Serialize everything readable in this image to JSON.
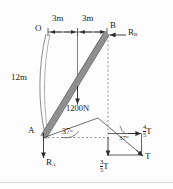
{
  "figure": {
    "type": "engineering-free-body-diagram",
    "title_text": "",
    "points": {
      "O": {
        "label": "O",
        "x": 43,
        "y": 31
      },
      "B": {
        "label": "B",
        "x": 108,
        "y": 30
      },
      "A": {
        "label": "A",
        "x": 41,
        "y": 136
      }
    },
    "dimensions": [
      {
        "label": "3m",
        "span": "O-to-midpoint"
      },
      {
        "label": "3m",
        "span": "midpoint-to-B"
      },
      {
        "label": "12m",
        "span": "O-to-A arc"
      }
    ],
    "loads": [
      {
        "label": "1200N",
        "direction": "down",
        "applied_at": "beam midpoint"
      }
    ],
    "reactions": [
      {
        "label": "R",
        "subscript": "B",
        "direction": "left",
        "at": "B"
      },
      {
        "label": "R",
        "subscript": "A",
        "direction": "down",
        "at": "A"
      }
    ],
    "angles": [
      {
        "value": "37",
        "unit": "o",
        "at": "A",
        "name": "beam-inclination"
      },
      {
        "value": "37",
        "unit": "o",
        "at": "force-triangle",
        "name": "tension-angle"
      }
    ],
    "tension_components": [
      {
        "numerator": "4",
        "denominator": "5",
        "symbol": "T",
        "name": "horizontal-component"
      },
      {
        "numerator": "3",
        "denominator": "5",
        "symbol": "T",
        "name": "vertical-component"
      },
      {
        "symbol": "T",
        "name": "resultant-tension"
      }
    ],
    "colors": {
      "beam": "#8f8f8f",
      "beam_edge": "#5a5a5a",
      "line": "#3a3a3a",
      "dashed": "#8a8a8a",
      "background": "#fdfdfd"
    }
  }
}
